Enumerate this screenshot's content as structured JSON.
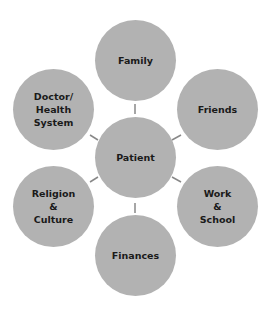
{
  "diagram": {
    "type": "hub-and-spoke",
    "colors": {
      "node_fill": "#b2b2b2",
      "connector": "#888888",
      "text": "#1a1a1a",
      "background": "#ffffff"
    },
    "center": {
      "label": "Patient"
    },
    "nodes": [
      {
        "id": "family",
        "label": "Family"
      },
      {
        "id": "friends",
        "label": "Friends"
      },
      {
        "id": "work",
        "label": "Work\n&\nSchool"
      },
      {
        "id": "finances",
        "label": "Finances"
      },
      {
        "id": "religion",
        "label": "Religion\n&\nCulture"
      },
      {
        "id": "doctor",
        "label": "Doctor/\nHealth\nSystem"
      }
    ]
  }
}
